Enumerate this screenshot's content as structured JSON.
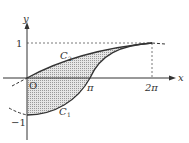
{
  "diagram": {
    "axes": {
      "x_label": "x",
      "y_label": "y",
      "origin_label": "O"
    },
    "ticks": {
      "x": [
        {
          "value": "π",
          "label": "π"
        },
        {
          "value": "2π",
          "label": "2π"
        }
      ],
      "y": [
        {
          "value": 1,
          "label": "1"
        },
        {
          "value": -1,
          "label": "−1"
        }
      ]
    },
    "curves": [
      {
        "name": "C",
        "subscript": "2",
        "description": "upper curve from O(0,0) rising to (2π,1)"
      },
      {
        "name": "C",
        "subscript": "1",
        "description": "lower curve from (0,−1) through (π,0) to (2π,1)"
      }
    ],
    "region": {
      "description": "shaded region between C1 and C2 for 0 ≤ x ≤ 2π",
      "fill": "dotted gray"
    },
    "colors": {
      "stroke": "#333333",
      "fill": "#c8c8c8",
      "background": "#ffffff"
    }
  }
}
